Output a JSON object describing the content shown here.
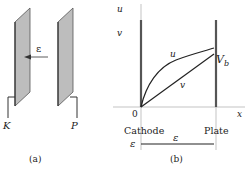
{
  "panel_a": {
    "caption": "(a)",
    "cathode_label": "K",
    "plate_label": "P",
    "field_label": "ε"
  },
  "panel_b": {
    "caption": "(b)",
    "y_axis_label": "u",
    "x_axis_label": "x",
    "origin_label": "0",
    "v_axis_label": "v",
    "curve_u_label": "u",
    "curve_v_label": "v",
    "vb_label": "V_b",
    "vb_main": "V",
    "vb_sub": "b",
    "cathode_label": "Cathode",
    "plate_label": "Plate",
    "field_left_label": "ε",
    "field_mid_label": "ε"
  },
  "colors": {
    "plate_fill": "#bdbdbd",
    "plate_edge": "#555555",
    "line": "#222222",
    "axis": "#999999"
  }
}
